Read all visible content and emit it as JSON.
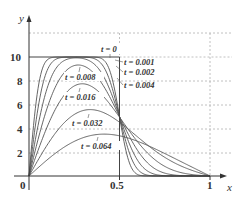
{
  "chart_data": {
    "type": "line",
    "title": "",
    "xlabel": "x",
    "ylabel": "y",
    "xlim": [
      0,
      1
    ],
    "ylim": [
      0,
      12
    ],
    "x_ticks": [
      "0",
      "0.5",
      "1"
    ],
    "y_ticks": [
      "2",
      "4",
      "6",
      "8",
      "10"
    ],
    "grid": "dashed at y=2,4,6,8,12 and x=0.5,1",
    "series": [
      {
        "name": "t=0",
        "t": 0,
        "label": "t=0"
      },
      {
        "name": "t=0.001",
        "t": 0.001,
        "label": "t=0.001"
      },
      {
        "name": "t=0.002",
        "t": 0.002,
        "label": "t=0.002"
      },
      {
        "name": "t=0.004",
        "t": 0.004,
        "label": "t=0.004"
      },
      {
        "name": "t=0.008",
        "t": 0.008,
        "label": "t=0.008"
      },
      {
        "name": "t=0.016",
        "t": 0.016,
        "label": "t=0.016"
      },
      {
        "name": "t=0.032",
        "t": 0.032,
        "label": "t=0.032"
      },
      {
        "name": "t=0.064",
        "t": 0.064,
        "label": "t=0.064"
      }
    ],
    "approx_peaks": [
      {
        "t": 0.008,
        "y": 9.4
      },
      {
        "t": 0.016,
        "y": 7.6
      },
      {
        "t": 0.032,
        "y": 5.6
      },
      {
        "t": 0.064,
        "y": 3.6
      }
    ]
  },
  "labels": {
    "y_axis": "y",
    "x_axis": "x",
    "origin": "0",
    "x_half": "0.5",
    "x_one": "1",
    "y10": "10",
    "y8": "8",
    "y6": "6",
    "y4": "4",
    "y2": "2",
    "t0": "t = 0",
    "t001": "t = 0.001",
    "t002": "t = 0.002",
    "t004": "t = 0.004",
    "t008": "t = 0.008",
    "t016": "t = 0.016",
    "t032": "t = 0.032",
    "t064": "t = 0.064"
  },
  "colors": {
    "curve": "#555555",
    "axis": "#333333",
    "grid": "#aaaaaa"
  }
}
